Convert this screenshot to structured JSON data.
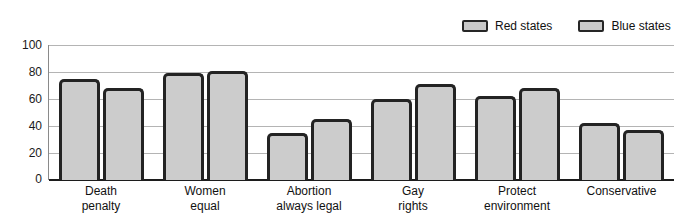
{
  "legend": {
    "position": "top-right",
    "entries": [
      {
        "label": "Red states",
        "swatch": "legend-swatch-red-states",
        "color": "#c9c9c9"
      },
      {
        "label": "Blue states",
        "swatch": "legend-swatch-blue-states",
        "color": "#c9c9c9"
      }
    ]
  },
  "axes": {
    "yticks": [
      "100",
      "80",
      "60",
      "40",
      "20",
      "0"
    ]
  },
  "labels": {
    "g0_l1": "Death",
    "g0_l2": "penalty",
    "g1_l1": "Women",
    "g1_l2": "equal",
    "g2_l1": "Abortion",
    "g2_l2": "always legal",
    "g3_l1": "Gay",
    "g3_l2": "rights",
    "g4_l1": "Protect",
    "g4_l2": "environment",
    "g5_l1": "Conservative",
    "g5_l2": ""
  },
  "chart_data": {
    "type": "bar",
    "title": "",
    "subtitle": "",
    "xlabel": "",
    "ylabel": "",
    "ylim": [
      0,
      100
    ],
    "yticks": [
      0,
      20,
      40,
      60,
      80,
      100
    ],
    "grid": true,
    "legend_position": "top-right",
    "categories": [
      "Death penalty",
      "Women equal",
      "Abortion always legal",
      "Gay rights",
      "Protect environment",
      "Conservative"
    ],
    "series": [
      {
        "name": "Red states",
        "values": [
          75,
          79,
          35,
          60,
          62,
          42
        ]
      },
      {
        "name": "Blue states",
        "values": [
          68,
          81,
          45,
          71,
          68,
          37
        ]
      }
    ],
    "bar_fill_color": "#cccccc",
    "bar_edge_color": "#232323",
    "gridline_color": "#b4b4b4",
    "axis_color": "#1c1c1c"
  }
}
